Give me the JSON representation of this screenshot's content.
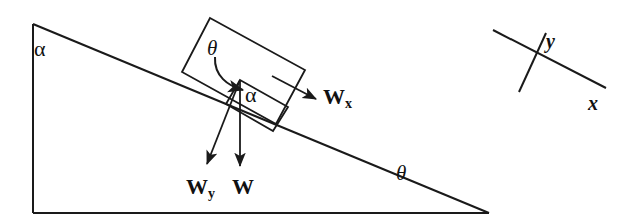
{
  "figure": {
    "background_color": "#ffffff",
    "stroke_color": "#1a1a1a",
    "width": 636,
    "height": 222
  },
  "labels": {
    "alpha_apex": "α",
    "alpha_block": "α",
    "theta_box": "θ",
    "theta_base": "θ",
    "weight_total": "W",
    "weight_perp_base": "W",
    "weight_perp_sub": "y",
    "weight_parallel_base": "W",
    "weight_parallel_sub": "x",
    "axis_y": "y",
    "axis_x": "x"
  },
  "geometry": {
    "incline_triangle": {
      "apex": [
        33,
        24
      ],
      "bottom_left": [
        33,
        213
      ],
      "bottom_right": [
        489,
        213
      ],
      "angle_at_base": "θ",
      "angle_at_apex": "α"
    },
    "construction_rectangle": {
      "corners": [
        [
          210,
          18
        ],
        [
          305,
          70
        ],
        [
          276,
          124
        ],
        [
          182,
          72
        ]
      ],
      "description": "rotated rectangle used to transfer the incline angle"
    },
    "block": {
      "corners": [
        [
          240,
          80
        ],
        [
          288,
          107
        ],
        [
          273,
          131
        ],
        [
          226,
          104
        ]
      ],
      "description": "small block resting on the incline surface"
    },
    "vectors": [
      {
        "name": "weight_total",
        "label": "W",
        "from": [
          240,
          80
        ],
        "to": [
          240,
          168
        ],
        "direction": "straight down (gravity)"
      },
      {
        "name": "weight_perpendicular",
        "label": "Wy",
        "from": [
          240,
          80
        ],
        "to": [
          205,
          166
        ],
        "direction": "down-left, perpendicular to incline surface"
      },
      {
        "name": "weight_parallel",
        "label": "Wx",
        "from": [
          280,
          82
        ],
        "to": [
          318,
          100
        ],
        "direction": "down-slope, parallel to incline surface"
      }
    ],
    "angle_arc": {
      "name": "theta-curved-arrow",
      "from": [
        215,
        58
      ],
      "to": [
        247,
        87
      ],
      "description": "curved arrow from theta label to block corner"
    },
    "coordinate_axes": {
      "x_axis": {
        "from": [
          493,
          30
        ],
        "to": [
          606,
          88
        ]
      },
      "y_axis": {
        "from": [
          519,
          92
        ],
        "to": [
          546,
          33
        ]
      },
      "origin": [
        531,
        62
      ],
      "description": "tilted axes aligned with the incline"
    }
  }
}
